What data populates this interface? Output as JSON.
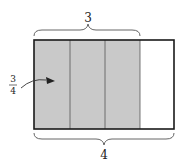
{
  "diagram": {
    "top_brace_label": "3",
    "bottom_brace_label": "4",
    "fraction": {
      "numerator": "3",
      "denominator": "4"
    },
    "parts_total": 4,
    "parts_shaded": 3,
    "colors": {
      "shaded": "#c9c9c9",
      "unshaded": "#ffffff",
      "border": "#1a1a1a",
      "divider": "#555555"
    }
  }
}
